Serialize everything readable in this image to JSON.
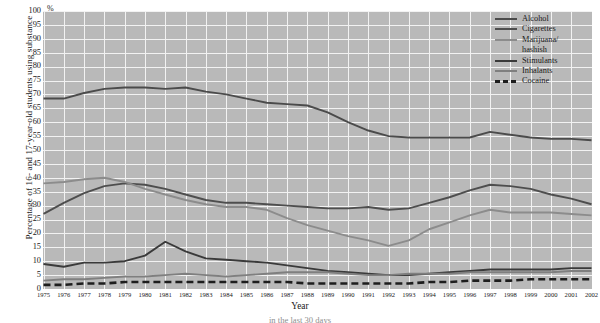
{
  "chart_data": {
    "type": "line",
    "title": "",
    "xlabel": "Year",
    "ylabel": "Percentage of 16- and 17-year-old students using substance",
    "unit_symbol": "%",
    "xlim": [
      1975,
      2002
    ],
    "ylim": [
      0,
      100
    ],
    "ytick_step": 5,
    "grid": true,
    "legend_position": "top-right",
    "categories": [
      "1975",
      "1976",
      "1977",
      "1978",
      "1979",
      "1980",
      "1981",
      "1982",
      "1983",
      "1984",
      "1985",
      "1986",
      "1987",
      "1988",
      "1989",
      "1990",
      "1991",
      "1992",
      "1993",
      "1994",
      "1995",
      "1996",
      "1997",
      "1998",
      "1999",
      "2000",
      "2001",
      "2002"
    ],
    "yticks": [
      "100",
      "95",
      "90",
      "85",
      "80",
      "75",
      "70",
      "65",
      "60",
      "55",
      "50",
      "45",
      "40",
      "35",
      "30",
      "25",
      "20",
      "15",
      "10",
      "5",
      "0"
    ],
    "series": [
      {
        "name": "Alcohol",
        "color": "#4b4b4b",
        "style": "solid",
        "values": [
          68.5,
          68.5,
          70.5,
          72,
          72.5,
          72.5,
          72,
          72.5,
          71,
          70,
          68.5,
          67,
          66.5,
          66,
          63.5,
          60,
          57,
          55,
          54.5,
          54.5,
          54.5,
          54.5,
          56.5,
          55.5,
          54.5,
          54,
          54,
          53.5
        ]
      },
      {
        "name": "Cigarettes",
        "color": "#4e4e4e",
        "style": "solid",
        "values": [
          27,
          31,
          34.5,
          37,
          38,
          37.5,
          36,
          34,
          32,
          31,
          31,
          30.5,
          30,
          29.5,
          29,
          29,
          29.5,
          28.5,
          29,
          31,
          33,
          35.5,
          37.5,
          37,
          36,
          34,
          32.5,
          30.5
        ]
      },
      {
        "name": "Marijuana/ hashish",
        "color": "#8c8c8c",
        "style": "solid",
        "values": [
          38,
          38.5,
          39.5,
          40,
          38.5,
          36,
          34,
          32,
          30.5,
          29.5,
          29.5,
          28.5,
          25.5,
          23,
          21,
          19,
          17.5,
          15.5,
          17.5,
          21.5,
          24,
          26.5,
          28.5,
          27.5,
          27.5,
          27.5,
          27,
          26.5
        ]
      },
      {
        "name": "Stimulants",
        "color": "#3a3a3a",
        "style": "solid",
        "values": [
          9,
          8,
          9.5,
          9.5,
          10,
          12,
          17,
          13.5,
          11,
          10.5,
          10,
          9.5,
          8.5,
          7.5,
          6.5,
          6,
          5.5,
          5,
          5,
          5.5,
          6,
          6.5,
          7,
          7,
          7,
          7,
          7.5,
          7.5
        ]
      },
      {
        "name": "Inhalants",
        "color": "#7f7f7f",
        "style": "solid",
        "values": [
          3,
          3.5,
          3.5,
          4,
          4.5,
          4.5,
          5,
          5.5,
          5,
          4.5,
          5,
          5.5,
          6,
          6,
          6,
          5.5,
          5,
          5,
          5.5,
          5.5,
          5.5,
          6,
          6,
          6,
          6,
          6,
          6.5,
          6.5
        ]
      },
      {
        "name": "Cocaine",
        "color": "#1d1d1d",
        "style": "dashed",
        "values": [
          1.5,
          1.5,
          2,
          2,
          2.5,
          2.5,
          2.5,
          2.5,
          2.5,
          2.5,
          2.5,
          2.5,
          2.5,
          2,
          2,
          2,
          2,
          2,
          2,
          2.5,
          2.5,
          3,
          3,
          3,
          3.5,
          3.5,
          3.5,
          3.5
        ]
      }
    ]
  },
  "legend": {
    "entries": [
      {
        "label": "Alcohol"
      },
      {
        "label": "Cigarettes"
      },
      {
        "label": "Marijuana/"
      },
      {
        "label": "hashish"
      },
      {
        "label": "Stimulants"
      },
      {
        "label": "Inhalants"
      },
      {
        "label": "Cocaine"
      }
    ]
  },
  "caption_partial": "in the last 30 days"
}
